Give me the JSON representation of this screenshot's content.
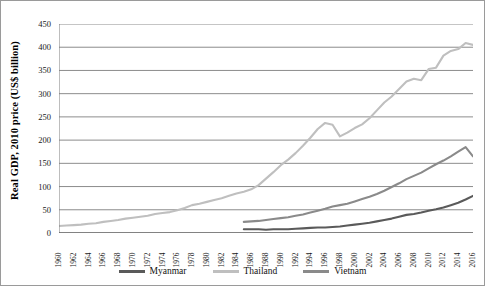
{
  "chart_data": {
    "type": "line",
    "title": "",
    "xlabel": "",
    "ylabel": "Real GDP, 2010 price (US$ billion)",
    "ylim": [
      0,
      450
    ],
    "ytick_step": 50,
    "yticks": [
      0,
      50,
      100,
      150,
      200,
      250,
      300,
      350,
      400,
      450
    ],
    "xlim": [
      1960,
      2016
    ],
    "xticks": [
      1960,
      1962,
      1964,
      1966,
      1968,
      1970,
      1972,
      1974,
      1976,
      1978,
      1980,
      1982,
      1984,
      1986,
      1988,
      1990,
      1992,
      1994,
      1996,
      1998,
      2000,
      2002,
      2004,
      2006,
      2008,
      2010,
      2012,
      2014,
      2016
    ],
    "x": [
      1960,
      1961,
      1962,
      1963,
      1964,
      1965,
      1966,
      1967,
      1968,
      1969,
      1970,
      1971,
      1972,
      1973,
      1974,
      1975,
      1976,
      1977,
      1978,
      1979,
      1980,
      1981,
      1982,
      1983,
      1984,
      1985,
      1986,
      1987,
      1988,
      1989,
      1990,
      1991,
      1992,
      1993,
      1994,
      1995,
      1996,
      1997,
      1998,
      1999,
      2000,
      2001,
      2002,
      2003,
      2004,
      2005,
      2006,
      2007,
      2008,
      2009,
      2010,
      2011,
      2012,
      2013,
      2014,
      2015,
      2016
    ],
    "grid": true,
    "grid_axis": "y",
    "legend_position": "bottom",
    "series": [
      {
        "name": "Myanmar",
        "color": "#5a5a5a",
        "start_year": 1985,
        "values": [
          null,
          null,
          null,
          null,
          null,
          null,
          null,
          null,
          null,
          null,
          null,
          null,
          null,
          null,
          null,
          null,
          null,
          null,
          null,
          null,
          null,
          null,
          null,
          null,
          null,
          8,
          8,
          8,
          7,
          8,
          8,
          8,
          9,
          10,
          11,
          12,
          12,
          13,
          14,
          16,
          18,
          20,
          22,
          25,
          28,
          31,
          35,
          39,
          41,
          44,
          48,
          51,
          55,
          60,
          65,
          72,
          80
        ]
      },
      {
        "name": "Thailand",
        "color": "#bfbfbf",
        "start_year": 1960,
        "values": [
          15,
          16,
          17,
          18,
          20,
          21,
          24,
          26,
          28,
          31,
          33,
          35,
          37,
          41,
          43,
          45,
          49,
          54,
          60,
          63,
          67,
          71,
          75,
          80,
          85,
          89,
          94,
          103,
          117,
          131,
          146,
          158,
          172,
          188,
          205,
          224,
          237,
          233,
          208,
          216,
          226,
          234,
          247,
          264,
          281,
          294,
          310,
          326,
          332,
          329,
          353,
          356,
          382,
          392,
          396,
          409,
          405
        ]
      },
      {
        "name": "Vietnam",
        "color": "#8a8a8a",
        "start_year": 1985,
        "values": [
          null,
          null,
          null,
          null,
          null,
          null,
          null,
          null,
          null,
          null,
          null,
          null,
          null,
          null,
          null,
          null,
          null,
          null,
          null,
          null,
          null,
          null,
          null,
          null,
          null,
          24,
          25,
          26,
          28,
          30,
          32,
          34,
          37,
          40,
          44,
          48,
          52,
          57,
          60,
          63,
          68,
          73,
          78,
          84,
          91,
          99,
          107,
          116,
          123,
          130,
          139,
          148,
          156,
          165,
          175,
          185,
          165
        ]
      }
    ]
  },
  "legend": {
    "items": [
      {
        "label": "Myanmar",
        "color": "#5a5a5a"
      },
      {
        "label": "Thailand",
        "color": "#bfbfbf"
      },
      {
        "label": "Vietnam",
        "color": "#8a8a8a"
      }
    ]
  },
  "axis": {
    "y_title": "Real GDP, 2010 price (US$ billion)"
  }
}
